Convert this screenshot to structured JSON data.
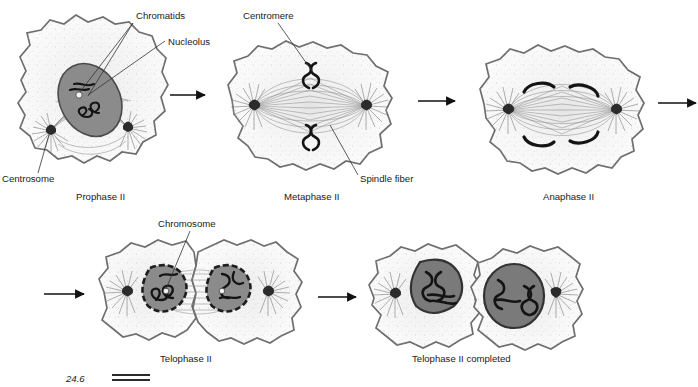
{
  "figure": {
    "type": "biology-process-diagram",
    "background_color": "#ffffff"
  },
  "colors": {
    "cell_fill": "#fbfbfb",
    "cell_outline": "#6e6e6e",
    "cytoplasm_stipple": "#b9b9b9",
    "nucleus_fill": "#8b8b8b",
    "nucleus_outline": "#4a4a4a",
    "nucleus_dark_fill": "#7a7a7a",
    "chromosome_dark": "#141414",
    "spindle_fiber": "#8d8d8d",
    "centrosome": "#141414",
    "text": "#1a1a1a",
    "arrow": "#111111"
  },
  "stages": [
    {
      "id": "prophase-2",
      "label": "Prophase II",
      "label_x": 76,
      "label_y": 200,
      "cell_cx": 98,
      "cell_cy": 95,
      "row": 1
    },
    {
      "id": "metaphase-2",
      "label": "Metaphase II",
      "label_x": 284,
      "label_y": 200,
      "cell_cx": 310,
      "cell_cy": 101,
      "row": 1
    },
    {
      "id": "anaphase-2",
      "label": "Anaphase II",
      "label_x": 543,
      "label_y": 200,
      "cell_cx": 562,
      "cell_cy": 105,
      "row": 1
    },
    {
      "id": "telophase-2",
      "label": "Telophase II",
      "label_x": 160,
      "label_y": 362,
      "cell_cx": 196,
      "cell_cy": 292,
      "row": 2
    },
    {
      "id": "telophase-2-completed",
      "label": "Telophase II completed",
      "label_x": 412,
      "label_y": 362,
      "cell_cx": 468,
      "cell_cy": 297,
      "row": 2
    }
  ],
  "callouts": [
    {
      "id": "chromatids",
      "text": "Chromatids",
      "text_x": 136,
      "text_y": 19,
      "leaders": [
        {
          "x1": 133,
          "y1": 23,
          "x2": 80,
          "y2": 92
        },
        {
          "x1": 133,
          "y1": 23,
          "x2": 88,
          "y2": 96
        }
      ]
    },
    {
      "id": "nucleolus",
      "text": "Nucleolus",
      "text_x": 168,
      "text_y": 45,
      "leaders": [
        {
          "x1": 165,
          "y1": 41,
          "x2": 88,
          "y2": 95
        }
      ]
    },
    {
      "id": "centrosome",
      "text": "Centrosome",
      "text_x": 2,
      "text_y": 182,
      "leaders": [
        {
          "x1": 38,
          "y1": 173,
          "x2": 50,
          "y2": 131
        }
      ]
    },
    {
      "id": "centromere",
      "text": "Centromere",
      "text_x": 243,
      "text_y": 19,
      "leaders": [
        {
          "x1": 278,
          "y1": 23,
          "x2": 312,
          "y2": 71
        }
      ]
    },
    {
      "id": "spindle-fiber",
      "text": "Spindle fiber",
      "text_x": 360,
      "text_y": 182,
      "leaders": [
        {
          "x1": 358,
          "y1": 175,
          "x2": 330,
          "y2": 125
        }
      ]
    },
    {
      "id": "chromosome",
      "text": "Chromosome",
      "text_x": 158,
      "text_y": 227,
      "leaders": [
        {
          "x1": 190,
          "y1": 231,
          "x2": 166,
          "y2": 289
        }
      ]
    }
  ],
  "arrows": [
    {
      "id": "arrow-prophase-metaphase",
      "x1": 170,
      "y1": 95,
      "x2": 205,
      "y2": 95,
      "clipped": false
    },
    {
      "id": "arrow-metaphase-anaphase",
      "x1": 418,
      "y1": 101,
      "x2": 455,
      "y2": 101,
      "clipped": false
    },
    {
      "id": "arrow-anaphase-telophase",
      "x1": 658,
      "y1": 103,
      "x2": 696,
      "y2": 103,
      "clipped": true
    },
    {
      "id": "arrow-into-telophase",
      "x1": 44,
      "y1": 294,
      "x2": 84,
      "y2": 294,
      "clipped": false
    },
    {
      "id": "arrow-telophase-completed",
      "x1": 318,
      "y1": 297,
      "x2": 356,
      "y2": 297,
      "clipped": false
    }
  ],
  "artifact": {
    "id": "page-edge-artifact",
    "text": "24.6",
    "x": 66,
    "y": 382,
    "note": "partially cropped figure-number text and rule at bottom edge"
  }
}
